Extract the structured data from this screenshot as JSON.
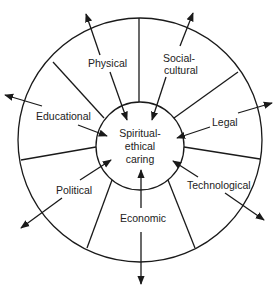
{
  "diagram": {
    "center": {
      "lines": [
        "Spiritual-",
        "ethical",
        "caring"
      ]
    },
    "factors": [
      {
        "name": "physical",
        "lines": [
          "Physical"
        ]
      },
      {
        "name": "social-cultural",
        "lines": [
          "Social-",
          "cultural"
        ]
      },
      {
        "name": "legal",
        "lines": [
          "Legal"
        ]
      },
      {
        "name": "technological",
        "lines": [
          "Technological"
        ]
      },
      {
        "name": "economic",
        "lines": [
          "Economic"
        ]
      },
      {
        "name": "political",
        "lines": [
          "Political"
        ]
      },
      {
        "name": "educational",
        "lines": [
          "Educational"
        ]
      }
    ],
    "colors": {
      "line": "#1a1a1a",
      "text": "#222222",
      "background": "#ffffff"
    }
  }
}
